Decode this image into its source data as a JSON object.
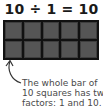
{
  "equation": "10 ÷ 1 = 10",
  "grid": {
    "rows": 2,
    "columns": 5,
    "cell_color": "#555555",
    "border_color": "#111111"
  },
  "caption": {
    "lines": [
      "The whole bar of",
      "10 squares has two",
      "factors: 1 and 10."
    ]
  },
  "arrow": {
    "icon": "curved-arrow-up-icon"
  }
}
